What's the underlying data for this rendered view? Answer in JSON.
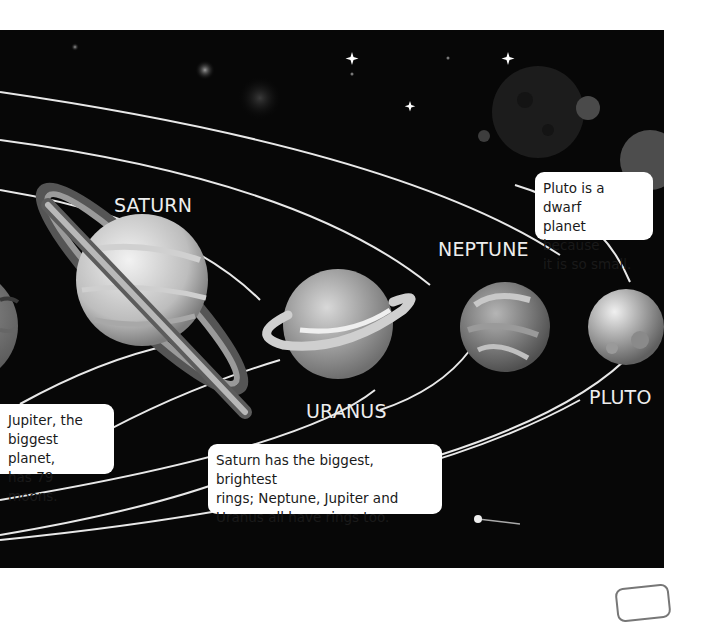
{
  "labels": {
    "saturn": "SATURN",
    "neptune": "NEPTUNE",
    "uranus": "URANUS",
    "pluto": "PLUTO"
  },
  "notes": {
    "pluto": [
      "Pluto is a dwarf",
      "planet because",
      "it is so small."
    ],
    "jupiter": [
      "Jupiter, the",
      "biggest planet,",
      "has 79 moons."
    ],
    "rings": [
      "Saturn has the biggest, brightest",
      "rings; Neptune, Jupiter and",
      "Uranus all have rings too."
    ]
  },
  "planets": [
    "Jupiter",
    "Saturn",
    "Uranus",
    "Neptune",
    "Pluto"
  ],
  "colors": {
    "background": "#070707",
    "page": "#ffffff",
    "orbit": "#e8e8e8",
    "note_bg": "#ffffff"
  }
}
